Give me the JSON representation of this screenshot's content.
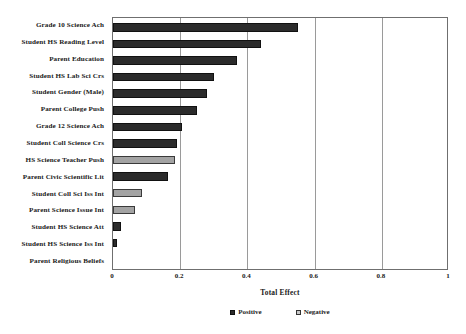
{
  "chart_data": {
    "type": "bar",
    "orientation": "horizontal",
    "title": "",
    "xlabel": "Total Effect",
    "ylabel": "",
    "xlim": [
      0,
      1
    ],
    "xticks": [
      "0",
      "0.2",
      "0.4",
      "0.6",
      "0.8",
      "1"
    ],
    "xtick_values": [
      0,
      0.2,
      0.4,
      0.6,
      0.8,
      1
    ],
    "grid": true,
    "grid_axis": "x",
    "legend_position": "bottom-center",
    "legend": [
      {
        "label": "Positive",
        "color": "#2b2b2b"
      },
      {
        "label": "Negative",
        "color": "#a3a3a3"
      }
    ],
    "categories": [
      "Grade 10 Science Ach",
      "Student HS Reading Level",
      "Parent Education",
      "Student HS Lab Sci Crs",
      "Student Gender (Male)",
      "Parent College Push",
      "Grade 12 Science Ach",
      "Student Coll Science Crs",
      "HS Science Teacher Push",
      "Parent Civic Scientific Lit",
      "Student Coll Sci Iss Int",
      "Parent Science Issue Int",
      "Student HS Science Att",
      "Student HS Science Iss Int",
      "Parent Religious Beliefs"
    ],
    "values": [
      0.55,
      0.44,
      0.37,
      0.3,
      0.28,
      0.25,
      0.205,
      0.19,
      0.185,
      0.165,
      0.085,
      0.065,
      0.025,
      0.012,
      0.0
    ],
    "signs": [
      "positive",
      "positive",
      "positive",
      "positive",
      "positive",
      "positive",
      "positive",
      "positive",
      "negative",
      "positive",
      "negative",
      "negative",
      "positive",
      "positive",
      "positive"
    ]
  }
}
